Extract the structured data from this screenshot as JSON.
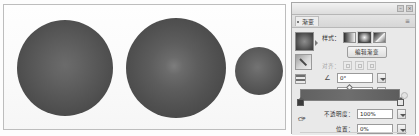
{
  "app": {
    "window_controls": [
      "minimize",
      "close"
    ]
  },
  "panel": {
    "tab_label": "渐变",
    "menu_icon": "panel-menu-icon",
    "style": {
      "label": "样式：",
      "options": [
        "linear-gradient",
        "radial-gradient",
        "angle-gradient"
      ],
      "selected_index": 1
    },
    "edit_button_label": "编辑渐变",
    "align": {
      "label": "对齐：",
      "buttons": [
        "align-left",
        "align-center",
        "align-right"
      ],
      "enabled": false
    },
    "angle": {
      "icon": "angle-icon",
      "value": "0°"
    },
    "scale": {
      "icon": "scale-icon",
      "value": "100%"
    },
    "gradient_bar": {
      "left_stop_color": "#3b3b3b",
      "right_stop_color": "#e6e6e6",
      "midpoint_position": "50%"
    },
    "opacity": {
      "label": "不透明度：",
      "value": "100%"
    },
    "location": {
      "label": "位置：",
      "value": "0%"
    },
    "preview_swatch": "radial-gradient-preview",
    "tools": [
      "gradient-pencil-tool",
      "gradient-list-tool"
    ]
  },
  "canvas": {
    "spheres": [
      {
        "name": "sphere-large-left",
        "size": 96,
        "center_color": "#6b6b6b",
        "edge_color": "#404040"
      },
      {
        "name": "sphere-large-middle",
        "size": 100,
        "center_color": "#7d7d7d",
        "edge_color": "#3f3f3f"
      },
      {
        "name": "sphere-small-right",
        "size": 48,
        "center_color": "#737373",
        "edge_color": "#414141"
      }
    ],
    "background": "#fbfbfb"
  }
}
